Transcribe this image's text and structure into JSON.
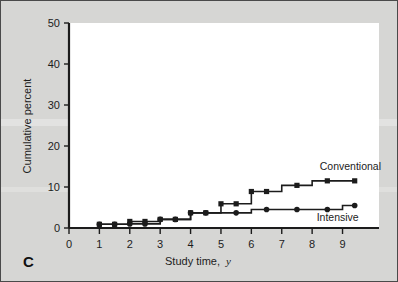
{
  "figure": {
    "panel_letter": "C",
    "background_color": "#d6d6d4",
    "plot_background_color": "#ffffff",
    "border_color": "#4a4a4a",
    "ink_color": "#1c1c1c"
  },
  "chart_data": {
    "type": "line",
    "subtype": "step",
    "title": "",
    "xlabel": "Study time, y",
    "xlabel_main": "Study time,",
    "xlabel_italic": "y",
    "ylabel": "Cumulative percent",
    "xlim": [
      0,
      10.2
    ],
    "ylim": [
      0,
      50
    ],
    "xticks": [
      0,
      1,
      2,
      3,
      4,
      5,
      6,
      7,
      8,
      9
    ],
    "xtick_labels": [
      "0",
      "1",
      "2",
      "3",
      "4",
      "5",
      "6",
      "7",
      "8",
      "9"
    ],
    "yticks": [
      0,
      10,
      20,
      30,
      40,
      50
    ],
    "ytick_labels": [
      "0",
      "10",
      "20",
      "30",
      "40",
      "50"
    ],
    "grid": false,
    "legend_position": "inline-right",
    "series": [
      {
        "name": "Conventional",
        "marker": "square",
        "label_x": 8.25,
        "label_y": 14.2,
        "x": [
          0,
          1,
          1.5,
          2,
          2.5,
          3,
          3.5,
          4,
          4.5,
          5,
          5.5,
          6,
          6.5,
          7.5,
          8.5,
          9.4
        ],
        "values": [
          0,
          0.8,
          0.9,
          1.5,
          1.6,
          1.8,
          2.1,
          3.6,
          3.7,
          5.8,
          5.9,
          8.8,
          8.9,
          10.4,
          11.5,
          11.5
        ],
        "steps": [
          {
            "x0": 0.0,
            "x1": 1.0,
            "y": 0.0
          },
          {
            "x0": 1.0,
            "x1": 2.0,
            "y": 0.9
          },
          {
            "x0": 2.0,
            "x1": 3.0,
            "y": 1.6
          },
          {
            "x0": 3.0,
            "x1": 4.0,
            "y": 2.1
          },
          {
            "x0": 4.0,
            "x1": 5.0,
            "y": 3.7
          },
          {
            "x0": 5.0,
            "x1": 6.0,
            "y": 5.9
          },
          {
            "x0": 6.0,
            "x1": 7.0,
            "y": 8.9
          },
          {
            "x0": 7.0,
            "x1": 8.0,
            "y": 10.4
          },
          {
            "x0": 8.0,
            "x1": 9.4,
            "y": 11.5
          }
        ],
        "markers": [
          {
            "x": 1.0,
            "y": 0.9
          },
          {
            "x": 1.5,
            "y": 0.9
          },
          {
            "x": 2.0,
            "y": 1.6
          },
          {
            "x": 2.5,
            "y": 1.6
          },
          {
            "x": 3.0,
            "y": 2.1
          },
          {
            "x": 3.5,
            "y": 2.1
          },
          {
            "x": 4.0,
            "y": 3.7
          },
          {
            "x": 4.5,
            "y": 3.7
          },
          {
            "x": 5.0,
            "y": 5.9
          },
          {
            "x": 5.5,
            "y": 5.9
          },
          {
            "x": 6.0,
            "y": 8.9
          },
          {
            "x": 6.5,
            "y": 8.9
          },
          {
            "x": 7.5,
            "y": 10.4
          },
          {
            "x": 8.5,
            "y": 11.5
          },
          {
            "x": 9.4,
            "y": 11.5
          }
        ]
      },
      {
        "name": "Intensive",
        "marker": "circle",
        "label_x": 8.15,
        "label_y": 1.6,
        "x": [
          0,
          1,
          1.5,
          2,
          2.5,
          3,
          3.5,
          4,
          4.5,
          5,
          5.5,
          6,
          6.5,
          7.5,
          8.5,
          9.4
        ],
        "values": [
          0,
          0.8,
          0.9,
          1.0,
          1.0,
          1.1,
          2.1,
          3.6,
          3.7,
          3.7,
          3.7,
          4.5,
          4.5,
          4.5,
          4.5,
          5.5
        ],
        "steps": [
          {
            "x0": 0.0,
            "x1": 1.0,
            "y": 0.0
          },
          {
            "x0": 1.0,
            "x1": 2.0,
            "y": 0.9
          },
          {
            "x0": 2.0,
            "x1": 3.0,
            "y": 1.0
          },
          {
            "x0": 3.0,
            "x1": 4.0,
            "y": 2.1
          },
          {
            "x0": 4.0,
            "x1": 5.0,
            "y": 3.7
          },
          {
            "x0": 5.0,
            "x1": 6.0,
            "y": 3.7
          },
          {
            "x0": 6.0,
            "x1": 9.0,
            "y": 4.5
          },
          {
            "x0": 9.0,
            "x1": 9.4,
            "y": 5.5
          }
        ],
        "markers": [
          {
            "x": 1.0,
            "y": 0.9
          },
          {
            "x": 1.5,
            "y": 0.9
          },
          {
            "x": 2.0,
            "y": 1.0
          },
          {
            "x": 2.5,
            "y": 1.0
          },
          {
            "x": 3.0,
            "y": 2.1
          },
          {
            "x": 3.5,
            "y": 2.1
          },
          {
            "x": 4.0,
            "y": 3.7
          },
          {
            "x": 4.5,
            "y": 3.7
          },
          {
            "x": 5.5,
            "y": 3.7
          },
          {
            "x": 6.5,
            "y": 4.5
          },
          {
            "x": 7.5,
            "y": 4.5
          },
          {
            "x": 8.5,
            "y": 4.5
          },
          {
            "x": 9.4,
            "y": 5.5
          }
        ]
      }
    ]
  }
}
